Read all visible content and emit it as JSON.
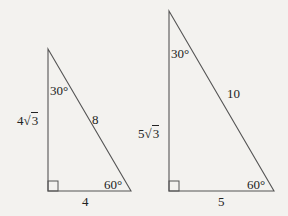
{
  "colors": {
    "background": "#f3f2ef",
    "stroke": "#555555",
    "text": "#222222"
  },
  "triangles": [
    {
      "id": "small",
      "vertices": {
        "top": [
          48,
          49
        ],
        "right_angle": [
          48,
          191
        ],
        "bottom_right": [
          131,
          191
        ]
      },
      "labels": {
        "top_angle": "30°",
        "bottom_right_angle": "60°",
        "vertical_leg_coeff": "4",
        "vertical_leg_radicand": "3",
        "hypotenuse": "8",
        "base": "4"
      }
    },
    {
      "id": "large",
      "vertices": {
        "top": [
          169,
          11
        ],
        "right_angle": [
          169,
          191
        ],
        "bottom_right": [
          274,
          191
        ]
      },
      "labels": {
        "top_angle": "30°",
        "bottom_right_angle": "60°",
        "vertical_leg_coeff": "5",
        "vertical_leg_radicand": "3",
        "hypotenuse": "10",
        "base": "5"
      }
    }
  ],
  "symbols": {
    "sqrt": "√"
  }
}
